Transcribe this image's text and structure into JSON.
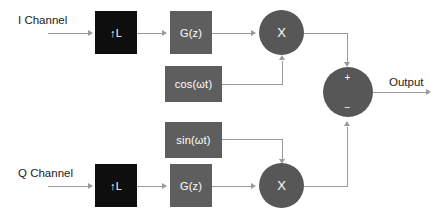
{
  "diagram": {
    "colors": {
      "background": "#ffffff",
      "interpolator_block": "#0e0e0e",
      "filter_block": "#5e5e5e",
      "operator_node": "#575757",
      "wire": "#9a9a9a",
      "label_text": "#1b1b1b",
      "block_text": "#ffffff"
    },
    "input_labels": {
      "i_channel": "I Channel",
      "q_channel": "Q Channel"
    },
    "output_label": "Output",
    "blocks": {
      "upsampler_i": "↑L",
      "upsampler_q": "↑L",
      "filter_i": "G(z)",
      "filter_q": "G(z)",
      "carrier_cos": "cos(ωt)",
      "carrier_sin": "sin(ωt)"
    },
    "nodes": {
      "mixer_i": "X",
      "mixer_q": "X",
      "summer_plus": "+",
      "summer_minus": "−"
    }
  }
}
